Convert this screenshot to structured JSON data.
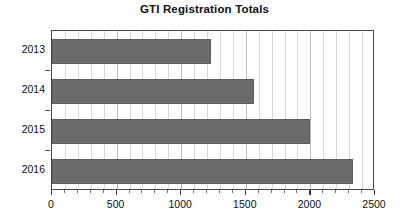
{
  "chart_data": {
    "type": "bar",
    "orientation": "horizontal",
    "title": "GTI Registration Totals",
    "xlabel": "",
    "ylabel": "",
    "categories": [
      "2013",
      "2014",
      "2015",
      "2016"
    ],
    "values": [
      1230,
      1560,
      2000,
      2330
    ],
    "series": [
      {
        "name": "GTI Registrations",
        "values": [
          1230,
          1560,
          2000,
          2330
        ]
      }
    ],
    "xlim": [
      0,
      2500
    ],
    "xticks": [
      0,
      500,
      1000,
      1500,
      2000,
      2500
    ],
    "xtick_labels": [
      "0",
      "500",
      "1000",
      "1500",
      "2000",
      "2500"
    ],
    "x_minor_tick_interval": 100,
    "grid": true,
    "grid_axis": "x",
    "legend": false,
    "legend_position": "none",
    "bar_color": "#6b6b6b",
    "bar_edge_color": "#5d5d5d",
    "plot_border_color": "#4a4a4a",
    "grid_minor_color": "#d8d8d8",
    "grid_major_color": "#bdbdbd",
    "background_color": "#ffffff",
    "text_color": "#101010"
  }
}
